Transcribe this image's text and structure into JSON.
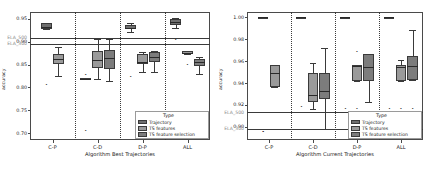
{
  "figure": {
    "background": "#ffffff",
    "colors": {
      "trajectory": "#6f6f6f",
      "ts_features": "#9a9a9a",
      "ts_feature_selection": "#7c7c7c",
      "axis": "#4a4a4a",
      "ela_label": "#8d8d8d",
      "reference_line": "#3a3a3a"
    }
  },
  "legend": {
    "title": "Type",
    "items": [
      {
        "label": "Trajectory",
        "color": "#6f6f6f"
      },
      {
        "label": "TS features",
        "color": "#9a9a9a"
      },
      {
        "label": "TS feature selection",
        "color": "#7c7c7c"
      }
    ]
  },
  "chart_data": [
    {
      "type": "box",
      "panel": "left",
      "title": "",
      "xlabel": "Algorithm Best Trajectories",
      "ylabel": "accuracy",
      "ylim": [
        0.685,
        0.965
      ],
      "yticks": [
        0.95,
        0.9,
        0.85,
        0.8,
        0.75,
        0.7
      ],
      "ytick_labels": [
        "0.95",
        "0.90",
        "0.85",
        "0.80",
        "0.75",
        "0.70"
      ],
      "categories": [
        "C-P",
        "C-D",
        "D-P",
        "ALL"
      ],
      "reference_lines": [
        {
          "label": "ELA_500",
          "value": 0.908
        },
        {
          "label": "ELA_300",
          "value": 0.895
        }
      ],
      "series": [
        {
          "name": "Trajectory",
          "boxes": [
            {
              "category": "C-P",
              "q1": 0.928,
              "median": 0.933,
              "q3": 0.94,
              "low": 0.928,
              "high": 0.94,
              "fliers": [
                0.806
              ]
            },
            {
              "category": "C-D",
              "q1": 0.818,
              "median": 0.819,
              "q3": 0.82,
              "low": 0.818,
              "high": 0.82,
              "fliers": [
                0.828,
                0.704
              ]
            },
            {
              "category": "D-P",
              "q1": 0.928,
              "median": 0.931,
              "q3": 0.936,
              "low": 0.921,
              "high": 0.941,
              "fliers": [
                0.822
              ]
            },
            {
              "category": "ALL",
              "q1": 0.937,
              "median": 0.943,
              "q3": 0.949,
              "low": 0.93,
              "high": 0.952,
              "fliers": [
                0.903,
                0.905
              ]
            }
          ]
        },
        {
          "name": "TS features",
          "boxes": [
            {
              "category": "C-P",
              "q1": 0.851,
              "median": 0.862,
              "q3": 0.874,
              "low": 0.824,
              "high": 0.889,
              "fliers": []
            },
            {
              "category": "C-D",
              "q1": 0.842,
              "median": 0.861,
              "q3": 0.88,
              "low": 0.818,
              "high": 0.905,
              "fliers": []
            },
            {
              "category": "D-P",
              "q1": 0.852,
              "median": 0.856,
              "q3": 0.873,
              "low": 0.833,
              "high": 0.878,
              "fliers": []
            },
            {
              "category": "ALL",
              "q1": 0.874,
              "median": 0.876,
              "q3": 0.879,
              "low": 0.874,
              "high": 0.879,
              "fliers": [
                0.849
              ]
            }
          ]
        },
        {
          "name": "TS feature selection",
          "boxes": [
            {
              "category": "C-D",
              "q1": 0.841,
              "median": 0.864,
              "q3": 0.882,
              "low": 0.814,
              "high": 0.906,
              "fliers": []
            },
            {
              "category": "D-P",
              "q1": 0.856,
              "median": 0.867,
              "q3": 0.878,
              "low": 0.833,
              "high": 0.88,
              "fliers": []
            },
            {
              "category": "ALL",
              "q1": 0.847,
              "median": 0.855,
              "q3": 0.862,
              "low": 0.83,
              "high": 0.867,
              "fliers": []
            }
          ]
        }
      ]
    },
    {
      "type": "box",
      "panel": "right",
      "title": "",
      "xlabel": "Algorithm Current Trajectories",
      "ylabel": "accuracy",
      "ylim": [
        0.888,
        1.005
      ],
      "yticks": [
        1.0,
        0.98,
        0.96,
        0.94,
        0.92,
        0.9
      ],
      "ytick_labels": [
        "1.00",
        "0.98",
        "0.96",
        "0.94",
        "0.92",
        "0.90"
      ],
      "categories": [
        "C-P",
        "C-D",
        "D-P",
        "ALL"
      ],
      "reference_lines": [
        {
          "label": "ELA_500",
          "value": 0.9135
        },
        {
          "label": "ELA_300",
          "value": 0.8985
        }
      ],
      "series": [
        {
          "name": "Trajectory",
          "boxes": [
            {
              "category": "C-P",
              "q1": 1.0,
              "median": 1.0,
              "q3": 1.0,
              "low": 1.0,
              "high": 1.0,
              "fliers": [
                0.8955,
                0.8955
              ]
            },
            {
              "category": "C-D",
              "q1": 1.0,
              "median": 1.0,
              "q3": 1.0,
              "low": 1.0,
              "high": 1.0,
              "fliers": [
                0.9185
              ]
            },
            {
              "category": "D-P",
              "q1": 1.0,
              "median": 1.0,
              "q3": 1.0,
              "low": 1.0,
              "high": 1.0,
              "fliers": [
                0.9165
              ]
            },
            {
              "category": "ALL",
              "q1": 1.0,
              "median": 1.0,
              "q3": 1.0,
              "low": 1.0,
              "high": 1.0,
              "fliers": [
                0.9165
              ]
            }
          ]
        },
        {
          "name": "TS features",
          "boxes": [
            {
              "category": "C-P",
              "q1": 0.9365,
              "median": 0.9495,
              "q3": 0.9565,
              "low": 0.9365,
              "high": 0.9565,
              "fliers": []
            },
            {
              "category": "C-D",
              "q1": 0.9225,
              "median": 0.9295,
              "q3": 0.9495,
              "low": 0.9165,
              "high": 0.9585,
              "fliers": []
            },
            {
              "category": "D-P",
              "q1": 0.9415,
              "median": 0.9555,
              "q3": 0.9565,
              "low": 0.9415,
              "high": 0.9565,
              "fliers": [
                0.9685,
                0.9165
              ]
            },
            {
              "category": "ALL",
              "q1": 0.9415,
              "median": 0.9545,
              "q3": 0.9565,
              "low": 0.9415,
              "high": 0.9615,
              "fliers": [
                0.9165
              ]
            }
          ]
        },
        {
          "name": "TS feature selection",
          "boxes": [
            {
              "category": "C-D",
              "q1": 0.9255,
              "median": 0.9325,
              "q3": 0.9495,
              "low": 0.8985,
              "high": 0.9725,
              "fliers": []
            },
            {
              "category": "D-P",
              "q1": 0.9415,
              "median": 0.9545,
              "q3": 0.9665,
              "low": 0.9225,
              "high": 0.9665,
              "fliers": []
            },
            {
              "category": "ALL",
              "q1": 0.9425,
              "median": 0.9555,
              "q3": 0.9645,
              "low": 0.9425,
              "high": 0.9885,
              "fliers": [
                0.9165
              ]
            }
          ]
        }
      ]
    }
  ]
}
